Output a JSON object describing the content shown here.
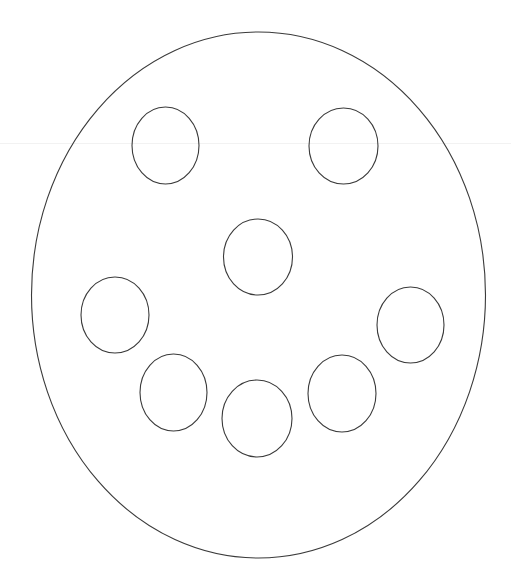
{
  "canvas": {
    "width": 511,
    "height": 583,
    "background": "#ffffff",
    "stroke_color": "#3a3a3a",
    "faint_line_color": "#f2f2f2"
  },
  "drawing": {
    "outer": {
      "name": "face-outline",
      "cx": 258.5,
      "cy": 295,
      "rx": 227,
      "ry": 263
    },
    "features": [
      {
        "name": "left-eye",
        "cx": 165.5,
        "cy": 145.5,
        "rx": 33.5,
        "ry": 38.5
      },
      {
        "name": "right-eye",
        "cx": 343.5,
        "cy": 146,
        "rx": 34.5,
        "ry": 38
      },
      {
        "name": "nose",
        "cx": 258,
        "cy": 257,
        "rx": 34.5,
        "ry": 38
      },
      {
        "name": "mouth-dot-far-left",
        "cx": 115,
        "cy": 315,
        "rx": 34,
        "ry": 38
      },
      {
        "name": "mouth-dot-left",
        "cx": 173.5,
        "cy": 392.5,
        "rx": 33.5,
        "ry": 38.5
      },
      {
        "name": "mouth-dot-center",
        "cx": 257,
        "cy": 418.5,
        "rx": 35,
        "ry": 38.5
      },
      {
        "name": "mouth-dot-right",
        "cx": 342,
        "cy": 393.5,
        "rx": 34,
        "ry": 38.5
      },
      {
        "name": "mouth-dot-far-right",
        "cx": 410.5,
        "cy": 325,
        "rx": 33.5,
        "ry": 38
      }
    ],
    "faint_line": {
      "x1": 0,
      "y1": 143.5,
      "x2": 511,
      "y2": 143.5
    }
  }
}
